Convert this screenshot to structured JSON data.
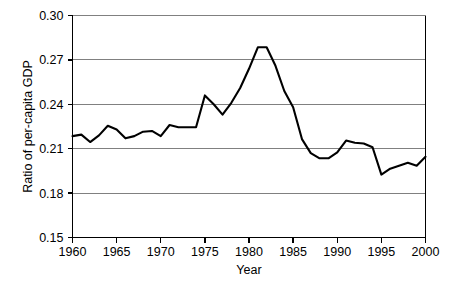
{
  "chart_data": {
    "type": "line",
    "title": "",
    "subtitle": "",
    "xlabel": "Year",
    "ylabel": "Ratio of per-capita GDP",
    "xlim": [
      1960,
      2000
    ],
    "ylim": [
      0.15,
      0.3
    ],
    "xticks": [
      1960,
      1965,
      1970,
      1975,
      1980,
      1985,
      1990,
      1995,
      2000
    ],
    "xtick_labels": [
      "1960",
      "1965",
      "1970",
      "1975",
      "1980",
      "1985",
      "1990",
      "1995",
      "2000"
    ],
    "yticks": [
      0.15,
      0.18,
      0.21,
      0.24,
      0.27,
      0.3
    ],
    "ytick_labels": [
      "0.15",
      "0.18",
      "0.21",
      "0.24",
      "0.27",
      "0.30"
    ],
    "grid": "horizontal",
    "legend": "none",
    "line_color": "#000000",
    "grid_color": "#808080",
    "axis_color": "#000000",
    "background_color": "#ffffff",
    "x": [
      1960,
      1961,
      1962,
      1963,
      1964,
      1965,
      1966,
      1967,
      1968,
      1969,
      1970,
      1971,
      1972,
      1973,
      1974,
      1975,
      1976,
      1977,
      1978,
      1979,
      1980,
      1981,
      1982,
      1983,
      1984,
      1985,
      1986,
      1987,
      1988,
      1989,
      1990,
      1991,
      1992,
      1993,
      1994,
      1995,
      1996,
      1997,
      1998,
      1999,
      2000
    ],
    "values": [
      0.2185,
      0.2195,
      0.2145,
      0.219,
      0.2255,
      0.223,
      0.217,
      0.2185,
      0.2215,
      0.222,
      0.2185,
      0.226,
      0.2245,
      0.2245,
      0.2245,
      0.246,
      0.24,
      0.233,
      0.241,
      0.251,
      0.264,
      0.2785,
      0.2785,
      0.266,
      0.249,
      0.238,
      0.2165,
      0.207,
      0.2035,
      0.2035,
      0.2075,
      0.2155,
      0.214,
      0.2135,
      0.211,
      0.1925,
      0.1965,
      0.1985,
      0.2005,
      0.1985,
      0.2045
    ]
  }
}
